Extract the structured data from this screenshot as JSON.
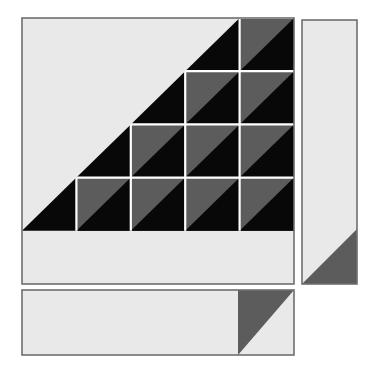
{
  "figure": {
    "canvas": {
      "width": 374,
      "height": 370,
      "background": "#ffffff"
    },
    "palette": {
      "light_face": "#e9e9e9",
      "light_face_alt": "#ececec",
      "mid_gray": "#5c5c5c",
      "dark_gray": "#555555",
      "black": "#080808",
      "outline": "#6e6e6e",
      "separator": "#ffffff"
    },
    "panels": {
      "main_square": {
        "label": "main-square",
        "x": 22,
        "y": 18,
        "width": 272,
        "height": 266,
        "fill": "#e9e9e9",
        "stroke": "#6e6e6e",
        "stroke_width": 1.6,
        "grid_cols": 5,
        "grid_rows": 5,
        "cell_width": 54.4,
        "cell_height": 53.2
      },
      "right_panel": {
        "label": "right-side-panel",
        "x": 302,
        "y": 20,
        "width": 55,
        "height": 264,
        "fill": "#e9e9e9",
        "stroke": "#6e6e6e",
        "stroke_width": 1.6,
        "shadow_fill": "#5c5c5c",
        "shadow_top_y": 230
      },
      "bottom_panel": {
        "label": "bottom-panel",
        "x": 22,
        "y": 290,
        "width": 272,
        "height": 65,
        "fill": "#e9e9e9",
        "stroke": "#6e6e6e",
        "stroke_width": 1.6,
        "shadow_fill": "#5c5c5c",
        "shadow_left_x": 238
      }
    },
    "pattern": {
      "description": "Lower-right triangular half of a 5x5 grid is tiled; each tiled cell contains a gray upper-left triangle and a black lower-right triangle. Remaining upper-left half is a solid black staircase region over a light background.",
      "tiled_cells": [
        {
          "row": 1,
          "col": 5
        },
        {
          "row": 2,
          "col": 4
        },
        {
          "row": 2,
          "col": 5
        },
        {
          "row": 3,
          "col": 3
        },
        {
          "row": 3,
          "col": 4
        },
        {
          "row": 3,
          "col": 5
        },
        {
          "row": 4,
          "col": 2
        },
        {
          "row": 4,
          "col": 3
        },
        {
          "row": 4,
          "col": 4
        },
        {
          "row": 4,
          "col": 5
        }
      ],
      "tiled_cell_count": 10,
      "cell_upper_triangle_fill": "#5c5c5c",
      "cell_lower_triangle_fill": "#080808",
      "staircase_fill": "#080808",
      "background_fill": "#e9e9e9"
    }
  }
}
